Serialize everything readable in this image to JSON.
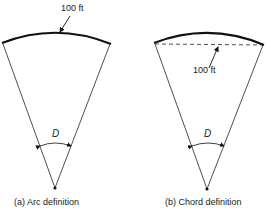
{
  "figures": [
    {
      "id": "a",
      "caption": "(a)  Arc definition",
      "length_label": "100 ft",
      "angle_label": "D",
      "measured_along": "arc"
    },
    {
      "id": "b",
      "caption": "(b)  Chord definition",
      "length_label": "100 ft",
      "angle_label": "D",
      "measured_along": "chord"
    }
  ]
}
